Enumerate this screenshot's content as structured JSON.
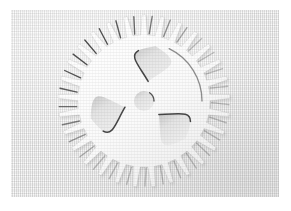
{
  "image": {
    "subject": "gear-sprocket-cutout",
    "description": "Photograph of a light gray textured panel with a gear / sprocket shape cut out in relief",
    "caption": "",
    "width": 291,
    "height": 211
  },
  "frame": {
    "border_color": "#ffffff",
    "border_left": 11,
    "border_top": 10,
    "panel_width": 268,
    "panel_height": 187
  },
  "palette": {
    "page_background": "#ffffff",
    "panel_base": "#eaeaea",
    "panel_highlight": "#f6f6f6",
    "panel_shadow": "#d7d7d7",
    "cut_face": "#fbfbfb",
    "cut_shadow": "#3a3a3a",
    "cut_midtone": "#c9c9c9"
  },
  "gear": {
    "label": "sprocket",
    "center_x": 133,
    "center_y": 91,
    "outer_radius": 86,
    "root_radius": 66,
    "rim_inner_radius": 58,
    "hub_radius": 15,
    "bore_radius": 10,
    "tooth_count": 29,
    "spoke_count": 3,
    "spoke_rotation_deg": -18,
    "tooth_tip_width_deg": 2.4,
    "tooth_base_width_deg": 5.6,
    "light_direction": "upper-left shadow, lower-right highlight"
  },
  "chart_data": null
}
